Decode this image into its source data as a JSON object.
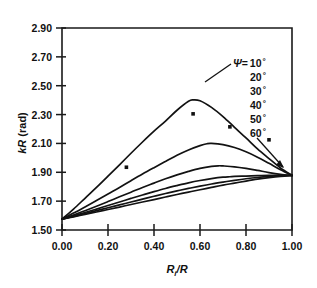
{
  "figure": {
    "background": "#ffffff",
    "ink": "#121212"
  },
  "axes": {
    "y_title": "kR (rad)",
    "y_title_symbol": "kR",
    "y_title_unit": " (rad)",
    "x_title": "R",
    "x_title_sub": "i",
    "x_title_rest": "/R",
    "y_ticks": [
      "1.50",
      "1.70",
      "1.90",
      "2.10",
      "2.30",
      "2.50",
      "2.70",
      "2.90"
    ],
    "x_ticks": [
      "0.00",
      "0.20",
      "0.40",
      "0.60",
      "0.80",
      "1.00"
    ]
  },
  "legend": {
    "symbol": "Ψ",
    "equals": "=",
    "entries": [
      {
        "value": "10",
        "unit": "°"
      },
      {
        "value": "20",
        "unit": "°"
      },
      {
        "value": "30",
        "unit": "°"
      },
      {
        "value": "40",
        "unit": "°"
      },
      {
        "value": "50",
        "unit": "°"
      },
      {
        "value": "60",
        "unit": "°"
      }
    ]
  },
  "chart_data": {
    "type": "line",
    "title": "",
    "xlabel": "Ri/R",
    "ylabel": "kR (rad)",
    "xlim": [
      0.0,
      1.0
    ],
    "ylim": [
      1.5,
      2.9
    ],
    "xticks": [
      0.0,
      0.2,
      0.4,
      0.6,
      0.8,
      1.0
    ],
    "yticks": [
      1.5,
      1.7,
      1.9,
      2.1,
      2.3,
      2.5,
      2.7,
      2.9
    ],
    "grid": false,
    "legend_position": "upper-right-inside",
    "series": [
      {
        "name": "Ψ = 10°",
        "x": [
          0.0,
          0.05,
          0.1,
          0.15,
          0.2,
          0.25,
          0.3,
          0.35,
          0.4,
          0.45,
          0.5,
          0.55,
          0.57,
          0.6,
          0.65,
          0.7,
          0.75,
          0.8,
          0.85,
          0.9,
          0.95,
          1.0
        ],
        "y": [
          1.575,
          1.645,
          1.72,
          1.795,
          1.873,
          1.952,
          2.032,
          2.11,
          2.185,
          2.255,
          2.33,
          2.392,
          2.402,
          2.396,
          2.35,
          2.286,
          2.212,
          2.138,
          2.062,
          1.995,
          1.93,
          1.878
        ]
      },
      {
        "name": "Ψ = 20°",
        "x": [
          0.0,
          0.05,
          0.1,
          0.15,
          0.2,
          0.25,
          0.3,
          0.35,
          0.4,
          0.45,
          0.5,
          0.55,
          0.6,
          0.63,
          0.65,
          0.7,
          0.75,
          0.8,
          0.85,
          0.9,
          0.95,
          1.0
        ],
        "y": [
          1.575,
          1.617,
          1.66,
          1.705,
          1.75,
          1.795,
          1.842,
          1.888,
          1.932,
          1.975,
          2.018,
          2.055,
          2.085,
          2.098,
          2.1,
          2.092,
          2.072,
          2.042,
          2.005,
          1.962,
          1.918,
          1.878
        ]
      },
      {
        "name": "Ψ = 30°",
        "x": [
          0.0,
          0.05,
          0.1,
          0.15,
          0.2,
          0.25,
          0.3,
          0.35,
          0.4,
          0.45,
          0.5,
          0.55,
          0.6,
          0.65,
          0.68,
          0.7,
          0.75,
          0.8,
          0.85,
          0.9,
          0.95,
          1.0
        ],
        "y": [
          1.575,
          1.604,
          1.634,
          1.665,
          1.697,
          1.73,
          1.762,
          1.795,
          1.825,
          1.855,
          1.882,
          1.906,
          1.927,
          1.941,
          1.945,
          1.944,
          1.938,
          1.927,
          1.913,
          1.898,
          1.886,
          1.878
        ]
      },
      {
        "name": "Ψ = 40°",
        "x": [
          0.0,
          0.05,
          0.1,
          0.15,
          0.2,
          0.25,
          0.3,
          0.35,
          0.4,
          0.45,
          0.5,
          0.55,
          0.6,
          0.65,
          0.7,
          0.73,
          0.75,
          0.8,
          0.85,
          0.9,
          0.95,
          1.0
        ],
        "y": [
          1.575,
          1.598,
          1.621,
          1.645,
          1.67,
          1.694,
          1.719,
          1.743,
          1.766,
          1.788,
          1.808,
          1.827,
          1.843,
          1.856,
          1.866,
          1.869,
          1.871,
          1.874,
          1.877,
          1.879,
          1.879,
          1.878
        ]
      },
      {
        "name": "Ψ = 50°",
        "x": [
          0.0,
          0.05,
          0.1,
          0.15,
          0.2,
          0.25,
          0.3,
          0.35,
          0.4,
          0.45,
          0.5,
          0.55,
          0.6,
          0.65,
          0.7,
          0.75,
          0.8,
          0.85,
          0.9,
          0.95,
          1.0
        ],
        "y": [
          1.575,
          1.594,
          1.614,
          1.634,
          1.654,
          1.674,
          1.694,
          1.714,
          1.734,
          1.753,
          1.771,
          1.788,
          1.804,
          1.819,
          1.832,
          1.844,
          1.855,
          1.864,
          1.871,
          1.876,
          1.878
        ]
      },
      {
        "name": "Ψ = 60°",
        "x": [
          0.0,
          0.05,
          0.1,
          0.15,
          0.2,
          0.25,
          0.3,
          0.35,
          0.4,
          0.45,
          0.5,
          0.55,
          0.6,
          0.65,
          0.7,
          0.75,
          0.8,
          0.85,
          0.9,
          0.95,
          1.0
        ],
        "y": [
          1.575,
          1.591,
          1.608,
          1.625,
          1.642,
          1.659,
          1.677,
          1.694,
          1.711,
          1.729,
          1.746,
          1.763,
          1.779,
          1.795,
          1.811,
          1.825,
          1.839,
          1.852,
          1.863,
          1.872,
          1.878
        ]
      }
    ],
    "scatter_points": {
      "name": "measured data",
      "marker": "square",
      "x": [
        0.28,
        0.57,
        0.73,
        0.9
      ],
      "y": [
        1.935,
        2.305,
        2.215,
        2.125
      ]
    }
  }
}
